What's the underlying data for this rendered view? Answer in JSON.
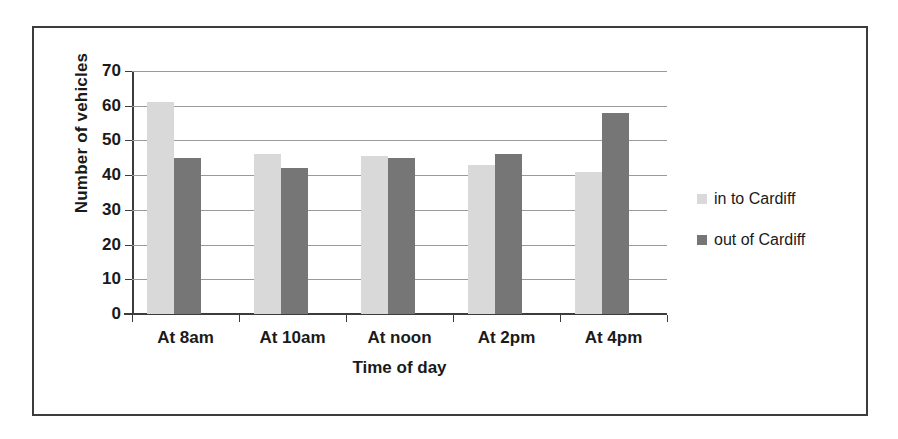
{
  "chart_data": {
    "type": "bar",
    "title": "",
    "xlabel": "Time of day",
    "ylabel": "Number of vehicles",
    "categories": [
      "At 8am",
      "At 10am",
      "At noon",
      "At 2pm",
      "At 4pm"
    ],
    "series": [
      {
        "name": "in to Cardiff",
        "values": [
          61,
          46,
          45.5,
          43,
          41
        ],
        "color": "#d9d9d9"
      },
      {
        "name": "out of Cardiff",
        "values": [
          45,
          42,
          45,
          46,
          58
        ],
        "color": "#767676"
      }
    ],
    "ylim": [
      0,
      70
    ],
    "ytick_labels": [
      "70",
      "60",
      "50",
      "40",
      "30",
      "20",
      "10",
      "0"
    ],
    "ytick_values": [
      70,
      60,
      50,
      40,
      30,
      20,
      10,
      0
    ],
    "grid": true,
    "legend_position": "right",
    "frame": true
  },
  "legend": {
    "items": [
      {
        "label": "in to Cardiff",
        "color": "#d9d9d9"
      },
      {
        "label": "out of Cardiff",
        "color": "#767676"
      }
    ]
  }
}
